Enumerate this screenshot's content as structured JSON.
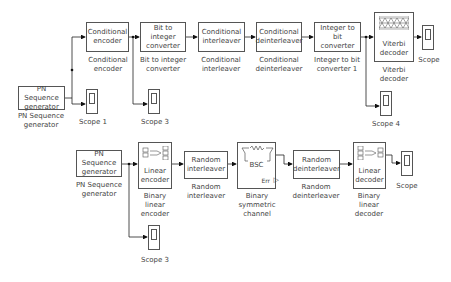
{
  "diagram": {
    "top_row": {
      "pn_generator": {
        "label": "PN Sequence\ngenerator",
        "caption": "PN Sequence\ngenerator"
      },
      "cond_encoder": {
        "label": "Conditional\nencoder",
        "caption": "Conditional\nencoder"
      },
      "bit_to_int": {
        "label": "Bit to integer\nconverter",
        "caption": "Bit to integer\nconverter"
      },
      "cond_interleaver": {
        "label": "Conditional\ninterleaver",
        "caption": "Conditional\ninterleaver"
      },
      "cond_deinterleaver": {
        "label": "Conditional\ndeinterleaver",
        "caption": "Conditional\ndeinterleaver"
      },
      "int_to_bit": {
        "label": "Integer to bit\nconverter",
        "caption": "Integer to bit\nconverter 1"
      },
      "viterbi": {
        "label": "Viterbi\ndecoder",
        "caption": "Viterbi\ndecoder"
      },
      "scope": {
        "caption": "Scope"
      },
      "scope1": {
        "caption": "Scope 1"
      },
      "scope3": {
        "caption": "Scope 3"
      },
      "scope4": {
        "caption": "Scope 4"
      }
    },
    "bottom_row": {
      "pn_generator": {
        "label": "PN Sequence\ngenerator",
        "caption": "PN Sequence\ngenerator"
      },
      "linear_encoder": {
        "label": "Linear\nencoder",
        "caption": "Binary\nlinear\nencoder"
      },
      "random_interleaver": {
        "label": "Random\ninterleaver",
        "caption": "Random\ninterleaver"
      },
      "bsc": {
        "label": "BSC",
        "err_port": "Err",
        "caption": "Binary\nsymmetric\nchannel"
      },
      "random_deinterleaver": {
        "label": "Random\ndeinterleaver",
        "caption": "Random\ndeinterleaver"
      },
      "linear_decoder": {
        "label": "Linear\ndecoder",
        "caption": "Binary\nlinear\ndecoder"
      },
      "scope": {
        "caption": "Scope"
      },
      "scope3": {
        "caption": "Scope 3"
      }
    }
  }
}
